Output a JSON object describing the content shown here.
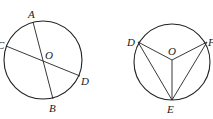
{
  "figures": [
    {
      "name": "figure-left",
      "circle": {
        "cx": 43,
        "cy": 60,
        "r": 39
      },
      "center_label": "O",
      "points": [
        {
          "label": "A",
          "x": 33,
          "y": 22,
          "lx": 28,
          "ly": 18
        },
        {
          "label": "B",
          "x": 53,
          "y": 99,
          "lx": 50,
          "ly": 111
        },
        {
          "label": "C",
          "x": 6,
          "y": 46,
          "lx": -3,
          "ly": 48
        },
        {
          "label": "D",
          "x": 80,
          "y": 76,
          "lx": 82,
          "ly": 84
        }
      ],
      "segments": [
        [
          "A",
          "B"
        ],
        [
          "C",
          "D"
        ]
      ]
    },
    {
      "name": "figure-right",
      "circle": {
        "cx": 172,
        "cy": 62,
        "r": 38
      },
      "center_label": "O",
      "points": [
        {
          "label": "D",
          "x": 138,
          "y": 42,
          "lx": 127,
          "ly": 46
        },
        {
          "label": "F",
          "x": 207,
          "y": 42,
          "lx": 208,
          "ly": 46
        },
        {
          "label": "E",
          "x": 172,
          "y": 100,
          "lx": 168,
          "ly": 113
        }
      ],
      "segments": [
        [
          "O",
          "D"
        ],
        [
          "O",
          "F"
        ],
        [
          "O",
          "E"
        ],
        [
          "D",
          "E"
        ],
        [
          "F",
          "E"
        ]
      ]
    }
  ],
  "labels": {
    "left": {
      "A": "A",
      "B": "B",
      "C": "C",
      "D": "D",
      "O": "O"
    },
    "right": {
      "D": "D",
      "F": "F",
      "E": "E",
      "O": "O"
    }
  }
}
